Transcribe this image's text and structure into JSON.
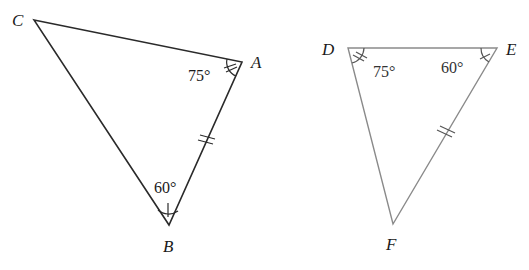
{
  "triangle_abc": {
    "vertices": {
      "A": {
        "label": "A",
        "x": 242,
        "y": 62
      },
      "B": {
        "label": "B",
        "x": 169,
        "y": 225
      },
      "C": {
        "label": "C",
        "x": 34,
        "y": 20
      }
    },
    "angles": {
      "A": "75°",
      "B": "60°"
    },
    "congruent_side": "AB",
    "stroke": "#2a2a2a"
  },
  "triangle_def": {
    "vertices": {
      "D": {
        "label": "D",
        "x": 348,
        "y": 48
      },
      "E": {
        "label": "E",
        "x": 497,
        "y": 48
      },
      "F": {
        "label": "F",
        "x": 393,
        "y": 224
      }
    },
    "angles": {
      "D": "75°",
      "E": "60°"
    },
    "congruent_side": "EF",
    "stroke": "#8a8a8a"
  }
}
